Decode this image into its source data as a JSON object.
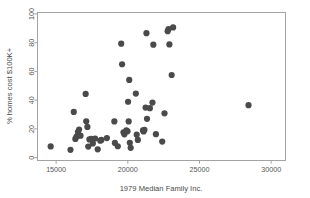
{
  "chart_data": {
    "type": "scatter",
    "title": "",
    "xlabel": "1979 Median Family Inc.",
    "ylabel": "% homes cost $100K+",
    "xlim": [
      13700,
      31000
    ],
    "ylim": [
      -2,
      101
    ],
    "xticks": [
      15000,
      20000,
      25000,
      30000
    ],
    "xtick_labels": [
      "15000",
      "20000",
      "25000",
      "30000"
    ],
    "yticks": [
      0,
      20,
      40,
      60,
      80,
      100
    ],
    "ytick_labels": [
      "0",
      "20",
      "40",
      "60",
      "80",
      "100"
    ],
    "grid": false,
    "legend": null,
    "marker": {
      "shape": "circle",
      "color": "#4a4a4a",
      "size": 3.1
    },
    "points": [
      {
        "x": 14620,
        "y": 7.8
      },
      {
        "x": 16000,
        "y": 5.4
      },
      {
        "x": 16230,
        "y": 31.8
      },
      {
        "x": 16340,
        "y": 13.0
      },
      {
        "x": 16420,
        "y": 14.6
      },
      {
        "x": 16520,
        "y": 17.8
      },
      {
        "x": 16600,
        "y": 19.5
      },
      {
        "x": 16700,
        "y": 15.3
      },
      {
        "x": 17060,
        "y": 44.3
      },
      {
        "x": 17100,
        "y": 25.3
      },
      {
        "x": 17180,
        "y": 21.4
      },
      {
        "x": 17240,
        "y": 7.7
      },
      {
        "x": 17320,
        "y": 12.7
      },
      {
        "x": 17450,
        "y": 13.0
      },
      {
        "x": 17560,
        "y": 9.9
      },
      {
        "x": 17720,
        "y": 13.3
      },
      {
        "x": 17900,
        "y": 5.8
      },
      {
        "x": 18080,
        "y": 11.8
      },
      {
        "x": 18160,
        "y": 12.3
      },
      {
        "x": 18540,
        "y": 13.6
      },
      {
        "x": 19060,
        "y": 25.2
      },
      {
        "x": 19100,
        "y": 10.2
      },
      {
        "x": 19300,
        "y": 7.9
      },
      {
        "x": 19540,
        "y": 79.3
      },
      {
        "x": 19600,
        "y": 65.0
      },
      {
        "x": 19700,
        "y": 17.6
      },
      {
        "x": 19760,
        "y": 16.2
      },
      {
        "x": 19900,
        "y": 19.0
      },
      {
        "x": 19980,
        "y": 18.3
      },
      {
        "x": 20020,
        "y": 38.9
      },
      {
        "x": 20060,
        "y": 25.2
      },
      {
        "x": 20100,
        "y": 54.1
      },
      {
        "x": 20140,
        "y": 10.3
      },
      {
        "x": 20200,
        "y": 6.8
      },
      {
        "x": 20560,
        "y": 44.6
      },
      {
        "x": 20620,
        "y": 16.0
      },
      {
        "x": 20700,
        "y": 12.3
      },
      {
        "x": 21060,
        "y": 18.9
      },
      {
        "x": 21100,
        "y": 18.2
      },
      {
        "x": 21160,
        "y": 19.4
      },
      {
        "x": 21240,
        "y": 34.8
      },
      {
        "x": 21300,
        "y": 86.6
      },
      {
        "x": 21340,
        "y": 27.0
      },
      {
        "x": 21540,
        "y": 34.4
      },
      {
        "x": 21720,
        "y": 38.3
      },
      {
        "x": 21780,
        "y": 78.6
      },
      {
        "x": 21960,
        "y": 16.3
      },
      {
        "x": 22400,
        "y": 11.2
      },
      {
        "x": 22560,
        "y": 30.8
      },
      {
        "x": 22780,
        "y": 88.0
      },
      {
        "x": 22840,
        "y": 89.5
      },
      {
        "x": 22900,
        "y": 78.8
      },
      {
        "x": 23060,
        "y": 57.5
      },
      {
        "x": 23160,
        "y": 90.6
      },
      {
        "x": 28420,
        "y": 36.5
      }
    ]
  }
}
